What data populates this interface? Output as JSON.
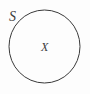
{
  "figure": {
    "type": "set-diagram",
    "background_color": "#fdfdfd",
    "width": 90,
    "height": 94,
    "stroke_color": "#3a3a3a",
    "text_color": "#3b3b3b"
  },
  "shapes": {
    "circle": {
      "name": "boundary-circle",
      "center_x": 44.5,
      "center_y": 46.5,
      "radius_x": 35.5,
      "radius_y": 36.5,
      "stroke_width": 1,
      "fill": "none"
    }
  },
  "labels": {
    "boundary": {
      "text": "S",
      "position": "outside-upper-left",
      "x": 9,
      "y": 10,
      "font_size": 14,
      "style": "italic"
    },
    "interior": {
      "text": "X",
      "position": "inside-center",
      "x": 41,
      "y": 41,
      "font_size": 12,
      "style": "italic"
    }
  }
}
